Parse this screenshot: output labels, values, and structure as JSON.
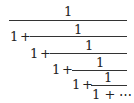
{
  "formula": {
    "description": "Infinite continued fraction 1/(1+1/(1+1/(1+1/(1+1/(1+...)))))",
    "numerator": "1",
    "one": "1",
    "plus": "+",
    "ellipsis": "⋯",
    "tail": "1 + ⋯"
  }
}
